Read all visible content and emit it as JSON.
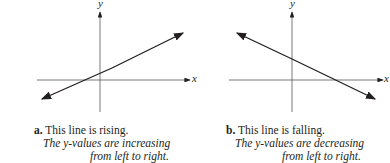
{
  "panels": [
    {
      "id": "a",
      "label": "a.",
      "title": " This line is rising.",
      "line2": "The y-values are increasing",
      "line3": "from left to right.",
      "x_axis": "x",
      "y_axis": "y",
      "trend": "rising"
    },
    {
      "id": "b",
      "label": "b.",
      "title": " This line is falling.",
      "line2": "The y-values are decreasing",
      "line3": "from left to right.",
      "x_axis": "x",
      "y_axis": "y",
      "trend": "falling"
    }
  ],
  "colors": {
    "ink": "#231f20",
    "axis": "#555555"
  }
}
